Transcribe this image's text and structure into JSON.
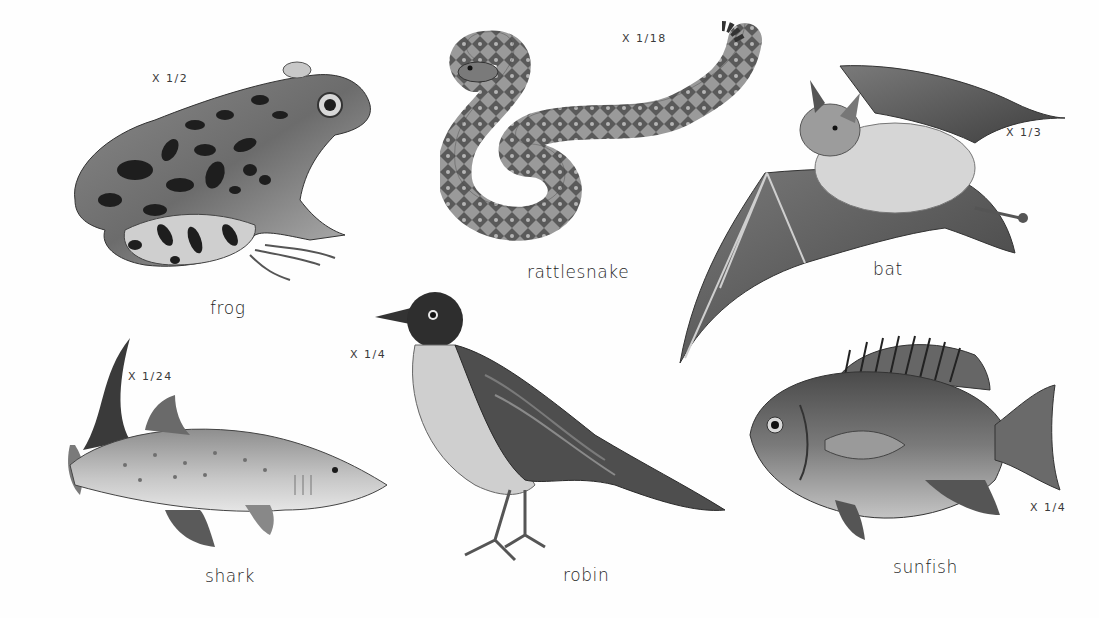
{
  "plate": {
    "animals": [
      {
        "name": "frog",
        "scale": "X 1/2"
      },
      {
        "name": "rattlesnake",
        "scale": "X 1/18"
      },
      {
        "name": "bat",
        "scale": "X 1/3"
      },
      {
        "name": "shark",
        "scale": "X 1/24"
      },
      {
        "name": "robin",
        "scale": "X 1/4"
      },
      {
        "name": "sunfish",
        "scale": "X 1/4"
      }
    ],
    "colors": {
      "background": "#ffffff",
      "ink_dark": "#1e1e1e",
      "ink_mid": "#6e6e6e",
      "ink_light": "#bdbdbd",
      "robin_breast": "#cfcfcf"
    }
  }
}
